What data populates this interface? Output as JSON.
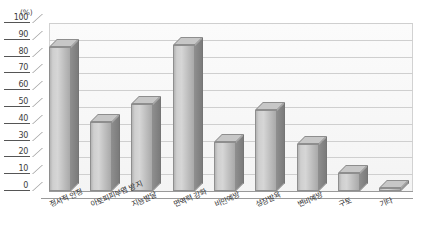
{
  "chart": {
    "unit_label": "(%)",
    "title": "",
    "axis": {
      "y_ticks": [
        "0",
        "10",
        "20",
        "30",
        "40",
        "50",
        "60",
        "70",
        "80",
        "90",
        "100"
      ]
    }
  },
  "chart_data": {
    "type": "bar",
    "title": "",
    "subtitle": "",
    "xlabel": "",
    "ylabel": "(%)",
    "ylim": [
      0,
      100
    ],
    "ytick_step": 10,
    "grid": true,
    "legend": false,
    "orientation": "vertical",
    "style": "3d-column",
    "categories": [
      "정서적 안정",
      "아토피피부염 방지",
      "지능발달",
      "면역력 강화",
      "비만예방",
      "성장발육",
      "변비예방",
      "구토",
      "기타"
    ],
    "values": [
      86,
      41,
      52,
      87,
      29,
      48,
      28,
      11,
      2
    ],
    "series": [
      {
        "name": "",
        "values": [
          86,
          41,
          52,
          87,
          29,
          48,
          28,
          11,
          2
        ]
      }
    ],
    "colors": {
      "bar_face": "#cfcfcf",
      "bar_side": "#8d8d8d",
      "bar_top": "#c7c7c7",
      "bar_outline": "#8e8e8e",
      "gridline": "#cfcfcf",
      "axis": "#555555",
      "plot_background": "#f7f7f7",
      "text": "#2e2e2e"
    }
  }
}
